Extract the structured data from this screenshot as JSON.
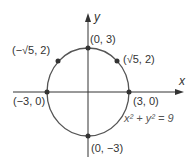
{
  "diagram": {
    "type": "circle-graph",
    "equation": "x² + y² = 9",
    "axes": {
      "x_label": "x",
      "y_label": "y"
    },
    "colors": {
      "circle": "#555555",
      "axis": "#333333",
      "point": "#333333"
    },
    "points": [
      {
        "label": "(0, 3)",
        "x": 0,
        "y": 3
      },
      {
        "label": "(√5, 2)",
        "x": 2.236,
        "y": 2
      },
      {
        "label": "(−√5, 2)",
        "x": -2.236,
        "y": 2
      },
      {
        "label": "(−3, 0)",
        "x": -3,
        "y": 0
      },
      {
        "label": "(3, 0)",
        "x": 3,
        "y": 0
      },
      {
        "label": "(0, −3)",
        "x": 0,
        "y": -3
      }
    ]
  }
}
